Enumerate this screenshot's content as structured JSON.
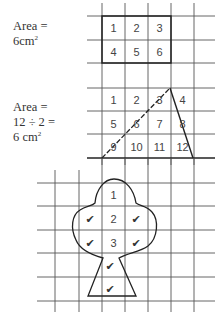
{
  "example1": {
    "label_line1": "Area =",
    "label_line2": "6cm",
    "label_sup": "2",
    "cells": [
      "1",
      "2",
      "3",
      "4",
      "5",
      "6"
    ]
  },
  "example2": {
    "label_line1": "Area =",
    "label_line2": "12 ÷ 2 =",
    "label_line3": "6 cm",
    "label_sup": "2",
    "cells": [
      "1",
      "2",
      "3",
      "4",
      "5",
      "6",
      "7",
      "8",
      "9",
      "10",
      "11",
      "12"
    ]
  },
  "example3": {
    "cells": [
      "1",
      "2",
      "3"
    ],
    "check_mark": "✔",
    "check_count": 6
  },
  "colors": {
    "grid": "#555555",
    "outline": "#222222",
    "background": "#ffffff"
  }
}
